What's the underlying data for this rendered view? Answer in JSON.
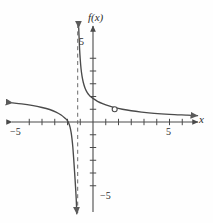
{
  "figure": {
    "title": "",
    "background": "#fefefe",
    "ink": "#4a4a4a",
    "text_color": "#2b2b2b"
  },
  "labels": {
    "y_axis": "f(x)",
    "x_axis": "x",
    "y_tick_positive": "5",
    "y_tick_negative": "−5",
    "x_tick_positive": "5",
    "x_tick_negative": "−5"
  },
  "chart_data": {
    "type": "line",
    "title": "",
    "xlabel": "x",
    "ylabel": "f(x)",
    "xlim": [
      -6.5,
      8.5
    ],
    "ylim": [
      -7.5,
      7.5
    ],
    "grid": false,
    "legend": null,
    "x_ticks": [
      -5,
      -4,
      -3,
      -2,
      -1,
      1,
      2,
      3,
      4,
      5,
      6,
      7
    ],
    "y_ticks": [
      -5,
      -4,
      -3,
      -2,
      -1,
      1,
      2,
      3,
      4,
      5
    ],
    "x_tick_labels": {
      "-5": "−5",
      "5": "5"
    },
    "y_tick_labels": {
      "5": "5",
      "-5": "−5"
    },
    "asymptotes": [
      {
        "type": "vertical",
        "x": -1.2,
        "style": "dashed"
      }
    ],
    "features": [
      {
        "type": "open-circle",
        "x": 1.7,
        "y": 1.0,
        "filled": false
      },
      {
        "type": "x-intercept",
        "x": -1.85,
        "y": 0
      }
    ],
    "series": [
      {
        "name": "left-branch",
        "arrow_start": true,
        "arrow_end": true,
        "points": [
          [
            -6.3,
            1.5
          ],
          [
            -5.6,
            1.42
          ],
          [
            -4.8,
            1.3
          ],
          [
            -4.0,
            1.14
          ],
          [
            -3.4,
            0.98
          ],
          [
            -2.9,
            0.78
          ],
          [
            -2.5,
            0.55
          ],
          [
            -2.2,
            0.3
          ],
          [
            -2.0,
            0.1
          ],
          [
            -1.9,
            -0.1
          ],
          [
            -1.8,
            -0.4
          ],
          [
            -1.72,
            -0.8
          ],
          [
            -1.65,
            -1.3
          ],
          [
            -1.58,
            -2.0
          ],
          [
            -1.52,
            -2.8
          ],
          [
            -1.46,
            -3.7
          ],
          [
            -1.4,
            -4.6
          ],
          [
            -1.34,
            -5.6
          ],
          [
            -1.3,
            -6.4
          ],
          [
            -1.27,
            -7.2
          ]
        ]
      },
      {
        "name": "right-branch",
        "arrow_start": true,
        "arrow_end": true,
        "points": [
          [
            -1.12,
            7.4
          ],
          [
            -1.09,
            6.6
          ],
          [
            -1.05,
            5.7
          ],
          [
            -1.0,
            4.9
          ],
          [
            -0.94,
            4.2
          ],
          [
            -0.86,
            3.6
          ],
          [
            -0.76,
            3.1
          ],
          [
            -0.62,
            2.65
          ],
          [
            -0.45,
            2.3
          ],
          [
            -0.25,
            2.05
          ],
          [
            0.0,
            1.85
          ],
          [
            0.35,
            1.62
          ],
          [
            0.8,
            1.42
          ],
          [
            1.25,
            1.26
          ],
          [
            1.7,
            1.13
          ],
          [
            2.3,
            1.0
          ],
          [
            3.0,
            0.88
          ],
          [
            3.8,
            0.78
          ],
          [
            4.8,
            0.68
          ],
          [
            6.0,
            0.6
          ],
          [
            7.3,
            0.54
          ],
          [
            8.2,
            0.5
          ]
        ]
      }
    ]
  }
}
